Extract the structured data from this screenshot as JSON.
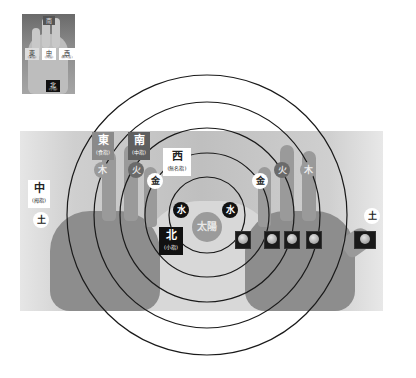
{
  "thumbnail": {
    "labels": [
      {
        "id": "top",
        "main": "南",
        "sub": ""
      },
      {
        "id": "east",
        "main": "東",
        "sub": "(食指)"
      },
      {
        "id": "center",
        "main": "中",
        "sub": "(拇指)"
      },
      {
        "id": "west",
        "main": "西",
        "sub": "(無名指)"
      },
      {
        "id": "north",
        "main": "北",
        "sub": "(小指)"
      }
    ]
  },
  "directions": {
    "east": {
      "main": "東",
      "sub": "(食指)"
    },
    "south": {
      "main": "南",
      "sub": "(中指)"
    },
    "west": {
      "main": "西",
      "sub": "(無名指)"
    },
    "center": {
      "main": "中",
      "sub": "(拇指)"
    },
    "north": {
      "main": "北",
      "sub": "(小指)"
    }
  },
  "elements": {
    "wood_left": "木",
    "fire_left": "火",
    "metal_left": "金",
    "water_left": "水",
    "water_right": "水",
    "metal_right": "金",
    "fire_right": "火",
    "wood_right": "木",
    "earth_left": "土",
    "earth_right": "土"
  },
  "sun": "太陽",
  "planets": [
    "mercury",
    "venus",
    "mars",
    "jupiter",
    "saturn"
  ],
  "colors": {
    "ring_stroke": "#1a1a1a",
    "east_bg": "#8a8a8a",
    "south_bg": "#5f5f5f",
    "north_bg": "#111111",
    "west_bg": "#ffffff",
    "sun_bg": "#9b9b9b"
  },
  "rings": {
    "center": [
      207,
      215
    ],
    "radii": [
      38,
      62,
      87,
      113,
      140
    ]
  }
}
